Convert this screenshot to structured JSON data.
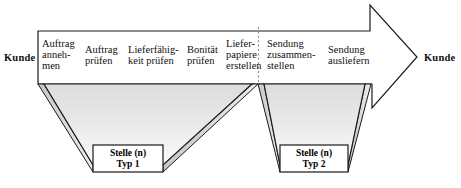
{
  "diagram": {
    "type": "process-chain-arrow",
    "colors": {
      "outline": "#1a1a1a",
      "band_fill": "#ffffff",
      "trapezoid_top": "#e2e2e2",
      "trapezoid_bottom": "#fbfbfb",
      "side_face": "#d0d0d0",
      "divider": "#8a8a8a",
      "text": "#111111"
    }
  },
  "actors": {
    "left": "Kunde",
    "right": "Kunde"
  },
  "activities": [
    {
      "id": "auftrag-annehmen",
      "label": "Auftrag\nanneh-\nmen",
      "segment": "typ1"
    },
    {
      "id": "auftrag-pruefen",
      "label": "Auftrag\nprüfen",
      "segment": "typ1"
    },
    {
      "id": "lieferfaehigkeit",
      "label": "Lieferfähig-\nkeit prüfen",
      "segment": "typ1"
    },
    {
      "id": "bonitaet-pruefen",
      "label": "Bonität\nprüfen",
      "segment": "typ1"
    },
    {
      "id": "lieferpapiere",
      "label": "Liefer-\npapiere\nerstellen",
      "segment": "typ1"
    },
    {
      "id": "sendung-zusammen",
      "label": "Sendung\nzusammen-\nstellen",
      "segment": "typ2"
    },
    {
      "id": "sendung-ausliefern",
      "label": "Sendung\nausliefern",
      "segment": "typ2"
    }
  ],
  "org_units": [
    {
      "id": "stelle-typ1",
      "line1": "Stelle (n)",
      "line2": "Typ 1"
    },
    {
      "id": "stelle-typ2",
      "line1": "Stelle (n)",
      "line2": "Typ 2"
    }
  ]
}
